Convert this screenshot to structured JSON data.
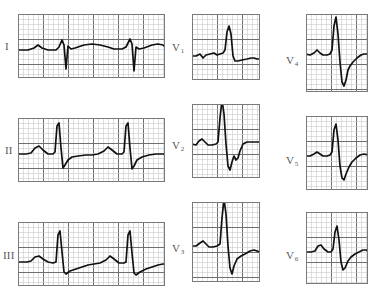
{
  "figure": {
    "kind": "ecg-12-lead-grid",
    "background_color": "#ffffff",
    "trace_color": "#111111",
    "grid_minor_color": "#c9c9c9",
    "grid_major_color": "#6f6f6f",
    "frame_color": "#7a7a7a",
    "label_color": "#585858",
    "minor_cell_px": 5,
    "major_every": 5
  },
  "columns": [
    {
      "name": "limb-leads",
      "leads": [
        "I",
        "II",
        "III"
      ]
    },
    {
      "name": "precordial-anterior",
      "leads": [
        "V1",
        "V2",
        "V3"
      ]
    },
    {
      "name": "precordial-lateral",
      "leads": [
        "V4",
        "V5",
        "V6"
      ]
    }
  ],
  "panels": [
    {
      "id": "lead-I",
      "label_main": "I",
      "label_sub": "",
      "x": 18,
      "y": 14,
      "w": 147,
      "h": 64,
      "label_x": 5,
      "label_y": 41,
      "baseline_frac": 0.56,
      "trace": "M0,36 L10,36 L16,34 L20,31 L24,34 L30,36 L38,36 L41,33 L44,26 L46,31 L48,55 L50,32 L53,35 L57,34 L66,31 L74,30 L82,31 L90,33 L96,35 L104,35 L108,33 L112,25 L114,30 L116,57 L118,33 L121,35 L126,34 L134,31 L140,30 L145,31 L147,33"
    },
    {
      "id": "lead-II",
      "label_main": "II",
      "label_sub": "",
      "x": 18,
      "y": 118,
      "w": 147,
      "h": 64,
      "label_x": 5,
      "label_y": 145,
      "baseline_frac": 0.56,
      "trace": "M0,36 L8,36 L13,35 L17,30 L21,28 L25,32 L30,36 L35,36 L37,34 L39,8 L41,5 L43,30 L45,50 L47,47 L50,42 L54,39 L60,38 L68,37 L74,37 L80,36 L86,33 L90,29 L94,32 L99,36 L104,36 L106,34 L108,8 L110,5 L112,30 L114,51 L116,48 L119,42 L124,39 L131,37 L138,36 L144,36 L147,36"
    },
    {
      "id": "lead-III",
      "label_main": "III",
      "label_sub": "",
      "x": 18,
      "y": 222,
      "w": 147,
      "h": 64,
      "label_x": 3,
      "label_y": 250,
      "baseline_frac": 0.62,
      "trace": "M0,40 L9,40 L13,39 L17,35 L21,34 L25,37 L30,40 L35,41 L38,40 L40,13 L42,9 L44,30 L46,50 L48,52 L52,49 L58,47 L64,45 L70,43 L76,42 L82,41 L88,38 L92,34 L96,37 L101,41 L106,41 L108,40 L110,13 L112,9 L114,31 L116,51 L118,53 L122,50 L128,47 L134,45 L140,43 L145,42 L147,42"
    },
    {
      "id": "lead-V1",
      "label_main": "V",
      "label_sub": "1",
      "x": 192,
      "y": 14,
      "w": 68,
      "h": 66,
      "label_x": 172,
      "label_y": 42,
      "baseline_frac": 0.6,
      "trace": "M0,42 L4,42 L8,40 L11,44 L14,41 L18,40 L22,39 L25,41 L28,40 L31,39 L33,36 L35,18 L37,12 L39,20 L41,42 L43,47 L46,47 L50,46 L55,45 L59,44 L62,44 L65,45 L68,45"
    },
    {
      "id": "lead-V2",
      "label_main": "V",
      "label_sub": "2",
      "x": 192,
      "y": 104,
      "w": 68,
      "h": 74,
      "label_x": 172,
      "label_y": 140,
      "baseline_frac": 0.52,
      "trace": "M0,40 L4,41 L7,37 L10,35 L13,38 L16,41 L20,41 L24,40 L26,38 L28,14 L30,-4 L32,10 L34,40 L36,62 L38,66 L40,58 L42,52 L44,56 L46,54 L48,47 L51,40 L55,38 L60,38 L64,38 L68,38"
    },
    {
      "id": "lead-V3",
      "label_main": "V",
      "label_sub": "3",
      "x": 192,
      "y": 202,
      "w": 68,
      "h": 80,
      "label_x": 172,
      "label_y": 243,
      "baseline_frac": 0.52,
      "trace": "M0,44 L4,44 L8,41 L11,39 L14,42 L17,45 L21,45 L25,44 L28,42 L30,16 L32,-3 L34,12 L36,44 L38,66 L40,72 L42,64 L45,57 L49,54 L53,52 L58,49 L62,48 L65,49 L68,50"
    },
    {
      "id": "lead-V4",
      "label_main": "V",
      "label_sub": "4",
      "x": 306,
      "y": 14,
      "w": 62,
      "h": 78,
      "label_x": 286,
      "label_y": 55,
      "baseline_frac": 0.48,
      "trace": "M0,40 L4,41 L8,39 L11,36 L14,39 L17,41 L21,41 L24,40 L26,36 L28,12 L30,3 L32,20 L34,48 L36,68 L38,72 L40,66 L42,56 L44,52 L47,48 L51,44 L55,41 L58,40 L62,40"
    },
    {
      "id": "lead-V5",
      "label_main": "V",
      "label_sub": "5",
      "x": 306,
      "y": 116,
      "w": 62,
      "h": 74,
      "label_x": 286,
      "label_y": 155,
      "baseline_frac": 0.5,
      "trace": "M0,40 L4,40 L8,38 L11,36 L14,38 L17,40 L21,40 L24,39 L26,36 L28,14 L30,8 L32,24 L34,50 L36,62 L38,64 L40,58 L43,51 L46,46 L50,42 L54,39 L58,38 L62,39"
    },
    {
      "id": "lead-V6",
      "label_main": "V",
      "label_sub": "6",
      "x": 306,
      "y": 212,
      "w": 62,
      "h": 72,
      "label_x": 286,
      "label_y": 250,
      "baseline_frac": 0.52,
      "trace": "M0,40 L5,40 L9,39 L12,34 L15,33 L18,37 L22,40 L25,40 L27,37 L29,20 L31,14 L33,28 L35,50 L37,58 L39,56 L42,49 L45,45 L49,42 L53,40 L57,38 L60,38 L62,39"
    }
  ]
}
